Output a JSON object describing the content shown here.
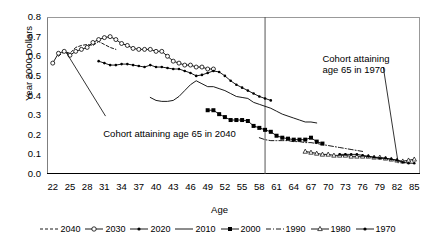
{
  "chart_data": {
    "type": "line",
    "title": "",
    "xlabel": "Age",
    "ylabel": "Year 2000 Dollars",
    "xlim": [
      21,
      86
    ],
    "ylim": [
      0.0,
      0.8
    ],
    "ytick_labels": [
      "0.0",
      "0.1",
      "0.2",
      "0.3",
      "0.4",
      "0.5",
      "0.6",
      "0.7",
      "0.8"
    ],
    "ytick_values": [
      0.0,
      0.1,
      0.2,
      0.3,
      0.4,
      0.5,
      0.6,
      0.7,
      0.8
    ],
    "xtick_labels": [
      "22",
      "25",
      "28",
      "31",
      "34",
      "37",
      "40",
      "43",
      "46",
      "49",
      "52",
      "55",
      "58",
      "61",
      "64",
      "67",
      "70",
      "73",
      "76",
      "79",
      "82",
      "85"
    ],
    "xtick_values": [
      22,
      25,
      28,
      31,
      34,
      37,
      40,
      43,
      46,
      49,
      52,
      55,
      58,
      61,
      64,
      67,
      70,
      73,
      76,
      79,
      82,
      85
    ],
    "grid": false,
    "legend_position": "bottom",
    "annotations": [
      {
        "name": "cohort-2040-annotation",
        "text": "Cohort attaining age 65 in 2040",
        "x": 31,
        "y": 0.245
      },
      {
        "name": "cohort-1970-annotation",
        "text_line1": "Cohort attaining",
        "text_line2": "age 65 in 1970",
        "x": 76,
        "y": 0.6
      }
    ],
    "reference_line": {
      "name": "vertical-divider",
      "x": 59
    },
    "series": [
      {
        "name": "2040",
        "label": "2040",
        "style": "dashed",
        "marker": "none",
        "x": [
          23,
          24,
          25,
          26,
          27,
          28,
          29,
          30,
          31,
          32,
          33
        ],
        "y": [
          0.6,
          0.625,
          0.615,
          0.645,
          0.655,
          0.66,
          0.655,
          0.675,
          0.66,
          0.645,
          0.635
        ]
      },
      {
        "name": "2030",
        "label": "2030",
        "style": "solid",
        "marker": "open-circle",
        "x": [
          22,
          23,
          24,
          25,
          26,
          27,
          28,
          29,
          30,
          31,
          32,
          33,
          34,
          35,
          36,
          37,
          38,
          39,
          40,
          41,
          42,
          43,
          44,
          45,
          46,
          47,
          48,
          49,
          50
        ],
        "y": [
          0.565,
          0.615,
          0.625,
          0.605,
          0.625,
          0.635,
          0.645,
          0.67,
          0.685,
          0.695,
          0.7,
          0.685,
          0.665,
          0.655,
          0.64,
          0.635,
          0.635,
          0.635,
          0.625,
          0.625,
          0.6,
          0.575,
          0.565,
          0.555,
          0.555,
          0.545,
          0.545,
          0.535,
          0.535
        ]
      },
      {
        "name": "2020",
        "label": "2020",
        "style": "solid",
        "marker": "filled-dot",
        "x": [
          30,
          31,
          32,
          33,
          34,
          35,
          36,
          37,
          38,
          39,
          40,
          41,
          42,
          43,
          44,
          45,
          46,
          47,
          48,
          49,
          50,
          51,
          52,
          53,
          54,
          55,
          56,
          57,
          58,
          59,
          60
        ],
        "y": [
          0.575,
          0.565,
          0.555,
          0.555,
          0.56,
          0.56,
          0.555,
          0.55,
          0.545,
          0.555,
          0.545,
          0.545,
          0.54,
          0.535,
          0.535,
          0.525,
          0.515,
          0.5,
          0.505,
          0.515,
          0.525,
          0.52,
          0.5,
          0.475,
          0.455,
          0.44,
          0.425,
          0.41,
          0.395,
          0.385,
          0.375
        ]
      },
      {
        "name": "2010",
        "label": "2010",
        "style": "solid",
        "marker": "none",
        "x": [
          39,
          40,
          41,
          42,
          43,
          44,
          45,
          46,
          47,
          48,
          49,
          50,
          51,
          52,
          53,
          54,
          55,
          56,
          57,
          58,
          59,
          60,
          61,
          62,
          63,
          64,
          65,
          66,
          67,
          68
        ],
        "y": [
          0.39,
          0.375,
          0.37,
          0.37,
          0.375,
          0.395,
          0.425,
          0.455,
          0.475,
          0.46,
          0.445,
          0.445,
          0.435,
          0.425,
          0.41,
          0.395,
          0.39,
          0.385,
          0.365,
          0.355,
          0.345,
          0.335,
          0.32,
          0.305,
          0.295,
          0.285,
          0.275,
          0.265,
          0.265,
          0.26
        ]
      },
      {
        "name": "2000",
        "label": "2000",
        "style": "solid",
        "marker": "filled-square",
        "x": [
          49,
          50,
          51,
          52,
          53,
          54,
          55,
          56,
          57,
          58,
          59,
          60,
          61,
          62,
          63,
          64,
          65,
          66,
          67,
          68,
          69
        ],
        "y": [
          0.325,
          0.325,
          0.305,
          0.29,
          0.275,
          0.275,
          0.275,
          0.27,
          0.245,
          0.235,
          0.225,
          0.215,
          0.195,
          0.185,
          0.18,
          0.175,
          0.175,
          0.175,
          0.185,
          0.165,
          0.155
        ]
      },
      {
        "name": "1990",
        "label": "1990",
        "style": "dash-dot",
        "marker": "none",
        "x": [
          58,
          59,
          60,
          61,
          62,
          63,
          64,
          65,
          66,
          67,
          68,
          69,
          70,
          71,
          72,
          73,
          74,
          75,
          76
        ],
        "y": [
          0.185,
          0.175,
          0.17,
          0.17,
          0.17,
          0.17,
          0.165,
          0.165,
          0.16,
          0.16,
          0.155,
          0.15,
          0.145,
          0.14,
          0.135,
          0.13,
          0.125,
          0.12,
          0.115
        ]
      },
      {
        "name": "1980",
        "label": "1980",
        "style": "solid",
        "marker": "open-triangle",
        "x": [
          66,
          67,
          68,
          69,
          70,
          71,
          72,
          73,
          74,
          75,
          76,
          77,
          78,
          79,
          80,
          81,
          82,
          83,
          84,
          85
        ],
        "y": [
          0.115,
          0.11,
          0.105,
          0.1,
          0.1,
          0.095,
          0.095,
          0.095,
          0.09,
          0.09,
          0.09,
          0.09,
          0.085,
          0.085,
          0.08,
          0.075,
          0.07,
          0.065,
          0.07,
          0.075
        ]
      },
      {
        "name": "1970",
        "label": "1970",
        "style": "solid",
        "marker": "filled-dot",
        "x": [
          72,
          73,
          74,
          75,
          76,
          77,
          78,
          79,
          80,
          81,
          82,
          83,
          84,
          85
        ],
        "y": [
          0.1,
          0.1,
          0.1,
          0.1,
          0.095,
          0.09,
          0.085,
          0.08,
          0.08,
          0.075,
          0.07,
          0.06,
          0.055,
          0.055
        ]
      }
    ],
    "legend": [
      {
        "label": "2040",
        "style": "dashed",
        "marker": "none"
      },
      {
        "label": "2030",
        "style": "solid",
        "marker": "open-circle"
      },
      {
        "label": "2020",
        "style": "solid",
        "marker": "filled-dot"
      },
      {
        "label": "2010",
        "style": "solid",
        "marker": "none"
      },
      {
        "label": "2000",
        "style": "solid",
        "marker": "filled-square"
      },
      {
        "label": "1990",
        "style": "dash-dot",
        "marker": "none"
      },
      {
        "label": "1980",
        "style": "solid",
        "marker": "open-triangle"
      },
      {
        "label": "1970",
        "style": "solid",
        "marker": "filled-dot"
      }
    ],
    "colors": {
      "line": "#000000",
      "axis": "#000000",
      "background": "#ffffff"
    }
  }
}
